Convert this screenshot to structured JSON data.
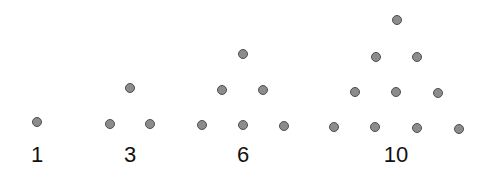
{
  "groups": [
    {
      "label": "1",
      "dots": [
        [
          37,
          122
        ]
      ]
    },
    {
      "label": "3",
      "dots": [
        [
          130,
          88
        ],
        [
          110,
          124
        ],
        [
          150,
          124
        ]
      ]
    },
    {
      "label": "6",
      "dots": [
        [
          243,
          54
        ],
        [
          222,
          90
        ],
        [
          263,
          90
        ],
        [
          202,
          125
        ],
        [
          243,
          125
        ],
        [
          284,
          126
        ]
      ]
    },
    {
      "label": "10",
      "dots": [
        [
          397,
          20
        ],
        [
          376,
          57
        ],
        [
          417,
          57
        ],
        [
          355,
          92
        ],
        [
          396,
          92
        ],
        [
          438,
          93
        ],
        [
          334,
          127
        ],
        [
          375,
          127
        ],
        [
          417,
          128
        ],
        [
          459,
          129
        ]
      ]
    }
  ],
  "label_x": [
    37,
    130,
    243,
    396
  ],
  "colors": {
    "dot_fill": "#8c8c8c",
    "dot_border": "#4f4f4f",
    "text": "#111111"
  }
}
